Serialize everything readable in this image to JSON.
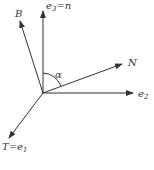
{
  "diagram": {
    "origin": {
      "x": 43,
      "y": 93
    },
    "color": "#333333",
    "vectors": [
      {
        "id": "e3",
        "label": "e",
        "sub": "3",
        "suffix": "=n",
        "tip": {
          "x": 43,
          "y": 10
        },
        "label_pos": {
          "x": 46,
          "y": 9
        }
      },
      {
        "id": "B",
        "label": "B",
        "sub": "",
        "suffix": "",
        "tip": {
          "x": 20,
          "y": 20
        },
        "label_pos": {
          "x": 15,
          "y": 17
        }
      },
      {
        "id": "N",
        "label": "N",
        "sub": "",
        "suffix": "",
        "tip": {
          "x": 122,
          "y": 64
        },
        "label_pos": {
          "x": 128,
          "y": 66
        }
      },
      {
        "id": "e2",
        "label": "e",
        "sub": "2",
        "suffix": "",
        "tip": {
          "x": 133,
          "y": 93
        },
        "label_pos": {
          "x": 138,
          "y": 97
        }
      },
      {
        "id": "T",
        "label": "T=e",
        "sub": "1",
        "suffix": "",
        "tip": {
          "x": 9,
          "y": 138
        },
        "label_pos": {
          "x": 2,
          "y": 150
        }
      }
    ],
    "angle": {
      "label": "α",
      "label_pos": {
        "x": 55,
        "y": 76
      }
    }
  }
}
